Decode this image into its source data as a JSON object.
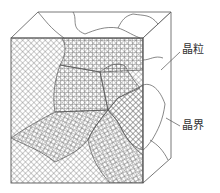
{
  "diagram": {
    "title": "",
    "type": "polycrystal-grain-structure",
    "labels": [
      {
        "id": "grain",
        "text": "晶粒"
      },
      {
        "id": "grain-boundary",
        "text": "晶界"
      }
    ],
    "colors": {
      "line": "#555555",
      "hatch": "#6b6b6b",
      "background": "#ffffff"
    }
  }
}
